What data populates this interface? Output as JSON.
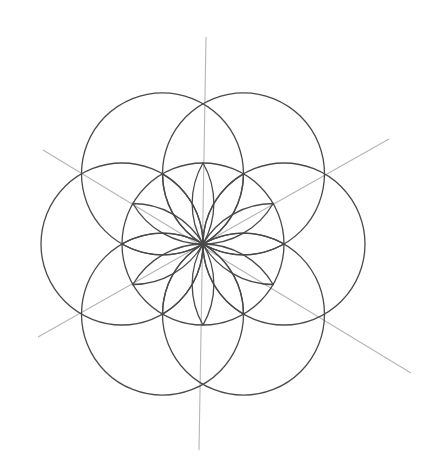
{
  "figure": {
    "center": [
      203,
      244
    ],
    "radius": 81,
    "outer_circle_angles_deg": [
      0,
      60,
      120,
      180,
      240,
      300
    ],
    "petal_count": 12,
    "axis_lines": [
      {
        "x1": 206,
        "y1": 37,
        "x2": 199,
        "y2": 450
      },
      {
        "x1": 43,
        "y1": 150,
        "x2": 411,
        "y2": 373
      },
      {
        "x1": 38,
        "y1": 337,
        "x2": 389,
        "y2": 139
      }
    ],
    "colors": {
      "stroke": "#4a4a4a",
      "axis": "#b5b5b5",
      "background": "#ffffff"
    }
  }
}
